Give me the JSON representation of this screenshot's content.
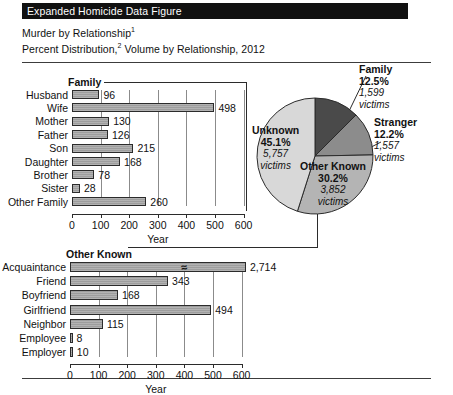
{
  "header": {
    "banner": "Expanded Homicide Data Figure",
    "line1_text": "Murder by Relationship",
    "line1_sup": "1",
    "line2_a": "Percent Distribution,",
    "line2_sup": "2",
    "line2_b": " Volume by Relationship, 2012"
  },
  "colors": {
    "banner_bg": "#111111",
    "bar_fill": "#9d9d9d",
    "pie_family": "#4a4a4a",
    "pie_stranger": "#8c8c8c",
    "pie_other_known": "#b4b4b4",
    "pie_unknown": "#d8d8d8",
    "axis": "#2b2b2b"
  },
  "chart_data": [
    {
      "type": "bar",
      "id": "family-chart",
      "orientation": "horizontal",
      "group_label": "Family",
      "title": "",
      "xlabel": "Year",
      "ylabel": "",
      "xlim": [
        0,
        600
      ],
      "xticks": [
        0,
        100,
        200,
        300,
        400,
        500,
        600
      ],
      "xticklabels": [
        "0",
        "100",
        "200",
        "300",
        "400",
        "500",
        "600"
      ],
      "grid": true,
      "categories": [
        "Husband",
        "Wife",
        "Mother",
        "Father",
        "Son",
        "Daughter",
        "Brother",
        "Sister",
        "Other Family"
      ],
      "values": [
        96,
        498,
        130,
        126,
        215,
        168,
        78,
        28,
        260
      ],
      "value_labels": [
        "96",
        "498",
        "130",
        "126",
        "215",
        "168",
        "78",
        "28",
        "260"
      ]
    },
    {
      "type": "bar",
      "id": "other-known-chart",
      "orientation": "horizontal",
      "group_label": "Other Known",
      "title": "",
      "xlabel": "Year",
      "ylabel": "",
      "xlim": [
        0,
        600
      ],
      "xticks": [
        0,
        100,
        200,
        300,
        400,
        500,
        600
      ],
      "xticklabels": [
        "0",
        "100",
        "200",
        "300",
        "400",
        "500",
        "600"
      ],
      "grid": true,
      "axis_break": {
        "category": "Acquaintance",
        "note": "bar truncated with break mark"
      },
      "categories": [
        "Acquaintance",
        "Friend",
        "Boyfriend",
        "Girlfriend",
        "Neighbor",
        "Employee",
        "Employer"
      ],
      "values": [
        2714,
        343,
        168,
        494,
        115,
        8,
        10
      ],
      "value_labels": [
        "2,714",
        "343",
        "168",
        "494",
        "115",
        "8",
        "10"
      ]
    },
    {
      "type": "pie",
      "id": "relationship-pie",
      "title": "",
      "legend_position": "callouts",
      "labels": [
        "Family",
        "Stranger",
        "Other Known",
        "Unknown"
      ],
      "percents": [
        12.5,
        12.2,
        30.2,
        45.1
      ],
      "values": [
        1599,
        1557,
        3852,
        5757
      ],
      "slices": [
        {
          "label": "Family",
          "percent": "12.5%",
          "victims": "1,599",
          "victims_word": "victims",
          "placement": "outside-top-right"
        },
        {
          "label": "Stranger",
          "percent": "12.2%",
          "victims": "1,557",
          "victims_word": "victims",
          "placement": "outside-right"
        },
        {
          "label": "Other Known",
          "percent": "30.2%",
          "victims": "3,852",
          "victims_word": "victims",
          "placement": "inside-bottom-right"
        },
        {
          "label": "Unknown",
          "percent": "45.1%",
          "victims": "5,757",
          "victims_word": "victims",
          "placement": "inside-left"
        }
      ]
    }
  ]
}
